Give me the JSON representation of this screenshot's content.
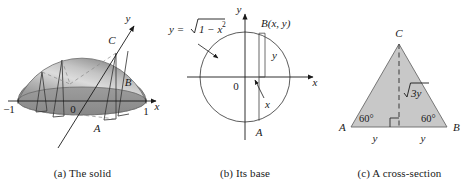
{
  "figure": {
    "background_color": "#ffffff",
    "ink_color": "#1a1a1a",
    "fill_gray": "#c8c8c8",
    "dome_light": "#e2e2e2",
    "dome_dark": "#8f8f8f"
  },
  "panel_a": {
    "caption": "(a) The solid",
    "labels": {
      "axis_y": "y",
      "axis_x": "x",
      "origin": "0",
      "tick_left": "−1",
      "tick_right": "1",
      "point_a": "A",
      "point_b": "B",
      "point_c": "C"
    }
  },
  "panel_b": {
    "caption": "(b) Its base",
    "labels": {
      "axis_y": "y",
      "axis_x": "x",
      "origin": "0",
      "curve_equation_lhs": "y =",
      "curve_equation_radicand": "1 − x",
      "curve_equation_exponent": "2",
      "point_b": "B(x, y)",
      "point_a": "A",
      "segment_y": "y",
      "segment_x": "x"
    }
  },
  "panel_c": {
    "caption": "(c) A cross-section",
    "labels": {
      "vertex_a": "A",
      "vertex_b": "B",
      "vertex_c": "C",
      "angle_left": "60°",
      "angle_right": "60°",
      "height": "3y",
      "height_radical": "√",
      "base_left": "y",
      "base_right": "y"
    }
  }
}
